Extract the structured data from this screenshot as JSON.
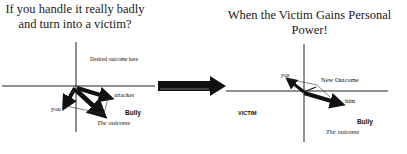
{
  "left_panel": {
    "title": "If you handle it really badly and turn into a victim?",
    "desired_label": "Desired outcome here",
    "attacker_label": "attacker",
    "you_label": "you",
    "bully_label": "Bully",
    "outcome_label": "The outcome"
  },
  "transition": {
    "arrow_icon": "big-right-arrow-icon"
  },
  "right_panel": {
    "title": "When the Victim Gains Personal Power!",
    "you_label": "you",
    "new_outcome_label": "New Outcome",
    "him_label": "him",
    "victim_label": "VICTIM",
    "bully_label": "Bully",
    "outcome_label": "The outcome"
  },
  "colors": {
    "ink": "#111111",
    "background": "#ffffff"
  }
}
